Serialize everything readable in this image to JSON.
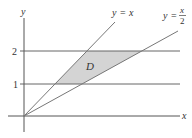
{
  "diagram": {
    "axes": {
      "x_label": "x",
      "y_label": "y"
    },
    "y_ticks": [
      {
        "label": "1",
        "value": 1
      },
      {
        "label": "2",
        "value": 2
      }
    ],
    "lines": [
      {
        "label_lhs": "y",
        "label_eq": "=",
        "label_rhs": "x",
        "equation": "y = x"
      },
      {
        "label_lhs": "y",
        "label_eq": "=",
        "label_num": "x",
        "label_den": "2",
        "equation": "y = x/2"
      }
    ],
    "horizontal_lines": [
      "y = 1",
      "y = 2"
    ],
    "region": {
      "label": "D",
      "fill": "#d4d4d4",
      "description": "region between y=1, y=2, y=x and y=x/2"
    },
    "colors": {
      "line": "#666666",
      "axis": "#444444",
      "region": "#d4d4d4"
    }
  }
}
